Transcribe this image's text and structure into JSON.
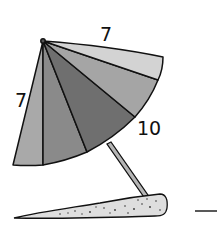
{
  "figure": {
    "labels": {
      "slant_top": "7",
      "slant_left": "7",
      "radius_right": "10"
    },
    "colors": {
      "panel_1": "#a9a9a9",
      "panel_2": "#8a8a8a",
      "panel_3": "#6f6f6f",
      "panel_4": "#a5a5a5",
      "panel_5": "#d3d3d3",
      "pole": "#b5b5b5",
      "sand": "#dedede",
      "outline": "#111111"
    },
    "dash": "—"
  }
}
